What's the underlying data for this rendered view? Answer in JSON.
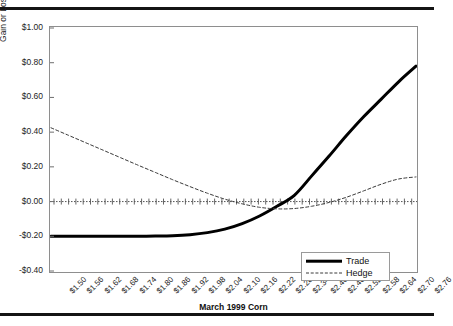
{
  "header": {
    "top_text": ""
  },
  "chart_data": {
    "type": "line",
    "title": "",
    "xlabel": "March 1999 Corn",
    "ylabel": "Gain or Loss ($) per Bushel",
    "grid": false,
    "legend_position": "bottom-right",
    "ylim": [
      -0.4,
      1.0
    ],
    "ytick_labels": [
      "$1.00",
      "$0.80",
      "$0.60",
      "$0.40",
      "$0.20",
      "$0.00",
      "-$0.20",
      "-$0.40"
    ],
    "ytick_values": [
      1.0,
      0.8,
      0.6,
      0.4,
      0.2,
      0.0,
      -0.2,
      -0.4
    ],
    "categories": [
      "$1.50",
      "$1.56",
      "$1.62",
      "$1.68",
      "$1.74",
      "$1.80",
      "$1.86",
      "$1.92",
      "$1.98",
      "$2.04",
      "$2.10",
      "$2.16",
      "$2.22",
      "$2.28",
      "$2.34",
      "$2.40",
      "$2.46",
      "$2.52",
      "$2.58",
      "$2.64",
      "$2.70",
      "$2.76"
    ],
    "x": [
      1.5,
      1.56,
      1.62,
      1.68,
      1.74,
      1.8,
      1.86,
      1.92,
      1.98,
      2.04,
      2.1,
      2.16,
      2.22,
      2.28,
      2.34,
      2.4,
      2.46,
      2.52,
      2.58,
      2.64,
      2.7,
      2.76
    ],
    "series": [
      {
        "name": "Trade",
        "style": "solid",
        "width": 3,
        "color": "#000000",
        "values": [
          -0.2,
          -0.2,
          -0.2,
          -0.2,
          -0.2,
          -0.2,
          -0.199,
          -0.197,
          -0.192,
          -0.181,
          -0.162,
          -0.131,
          -0.087,
          -0.032,
          0.032,
          0.1,
          0.06,
          0.0,
          0.0,
          0.0,
          0.0,
          0.0
        ]
      },
      {
        "name": "Hedge",
        "style": "dashed",
        "width": 1,
        "color": "#3a3a3a",
        "values": [
          0.425,
          0.382,
          0.339,
          0.296,
          0.253,
          0.21,
          0.168,
          0.126,
          0.086,
          0.048,
          0.014,
          -0.014,
          -0.034,
          -0.043,
          -0.04,
          -0.026,
          -0.004,
          0.0,
          0.0,
          0.0,
          0.0,
          0.0
        ]
      }
    ],
    "series_real": {
      "trade": [
        -0.2,
        -0.2,
        -0.2,
        -0.2,
        -0.2,
        -0.2,
        -0.199,
        -0.197,
        -0.191,
        -0.179,
        -0.159,
        -0.127,
        -0.083,
        -0.027,
        0.036,
        0.148,
        0.262,
        0.38,
        0.49,
        0.59,
        0.69,
        0.78
      ],
      "hedge": [
        0.425,
        0.382,
        0.339,
        0.296,
        0.253,
        0.21,
        0.168,
        0.126,
        0.086,
        0.048,
        0.014,
        -0.013,
        -0.033,
        -0.042,
        -0.04,
        -0.027,
        -0.005,
        0.025,
        0.062,
        0.1,
        0.13,
        0.142
      ]
    },
    "zero_line": {
      "value": 0.0,
      "style": "dotted-tick"
    }
  },
  "legend": {
    "entries": [
      {
        "label": "Trade",
        "style": "solid"
      },
      {
        "label": "Hedge",
        "style": "dashed"
      }
    ]
  }
}
